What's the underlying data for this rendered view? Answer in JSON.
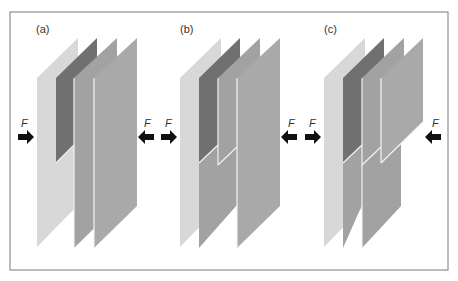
{
  "figure": {
    "frame": {
      "x": 10,
      "y": 12,
      "width": 438,
      "height": 258,
      "stroke": "#7a7a7a"
    },
    "colors": {
      "light_sheet": "#d8d8d8",
      "dark_sheet": "#707070",
      "mid_sheet": "#a2a2a2",
      "mid_sheet_alt": "#a9a9a9",
      "seam": "#f2f2f2",
      "arrow": "#111111"
    },
    "force_symbol": "F",
    "panels": [
      {
        "label": "(a)",
        "label_pos": [
          36,
          33
        ],
        "sheets": [
          {
            "name": "sheet-1-light",
            "color": "light_sheet",
            "points": "37,78 78,38 78,205 37,247"
          },
          {
            "name": "sheet-2-dark",
            "color": "dark_sheet",
            "points": "56,78 97,38 97,124 56,163"
          },
          {
            "name": "sheet-3-mid",
            "color": "mid_sheet",
            "points": "74,78 117,38 117,206 74,248"
          },
          {
            "name": "sheet-4-mid",
            "color": "mid_sheet_alt",
            "points": "94,78 137,38 137,206 94,248"
          }
        ],
        "seams": [
          {
            "points": "56,163 74,145"
          },
          {
            "points": "74,78 74,248"
          },
          {
            "points": "94,78 94,248"
          }
        ],
        "arrows": [
          {
            "direction": "right",
            "x": 18,
            "y": 137,
            "label_x": 21,
            "label_y": 127
          },
          {
            "direction": "left",
            "x": 154,
            "y": 137,
            "label_x": 144,
            "label_y": 127
          }
        ]
      },
      {
        "label": "(b)",
        "label_pos": [
          180,
          33
        ],
        "sheets": [
          {
            "name": "sheet-1-light",
            "color": "light_sheet",
            "points": "180,78 221,38 221,205 180,247"
          },
          {
            "name": "sheet-2-lower",
            "color": "mid_sheet",
            "points": "199,163 218,145 237,145 237,205 199,248"
          },
          {
            "name": "sheet-2-dark",
            "color": "dark_sheet",
            "points": "199,78 240,38 240,126 218,145 199,163"
          },
          {
            "name": "sheet-3-upper",
            "color": "mid_sheet",
            "points": "218,78 260,38 260,127 237,147 218,165"
          },
          {
            "name": "sheet-4-mid",
            "color": "mid_sheet_alt",
            "points": "237,78 280,38 280,206 237,248"
          }
        ],
        "seams": [
          {
            "points": "199,163 218,145"
          },
          {
            "points": "218,165 237,147"
          },
          {
            "points": "218,78 218,165"
          },
          {
            "points": "237,78 237,248"
          }
        ],
        "arrows": [
          {
            "direction": "right",
            "x": 161,
            "y": 137,
            "label_x": 165,
            "label_y": 127
          },
          {
            "direction": "left",
            "x": 297,
            "y": 137,
            "label_x": 288,
            "label_y": 127
          }
        ]
      },
      {
        "label": "(c)",
        "label_pos": [
          324,
          33
        ],
        "sheets": [
          {
            "name": "sheet-1-light",
            "color": "light_sheet",
            "points": "324,78 365,38 365,205 324,247"
          },
          {
            "name": "sheet-2-lower",
            "color": "mid_sheet",
            "points": "343,163 362,145 362,205 343,248"
          },
          {
            "name": "sheet-2-dark",
            "color": "dark_sheet",
            "points": "343,78 384,38 384,126 362,145 343,163"
          },
          {
            "name": "sheet-3-mid",
            "color": "mid_sheet",
            "points": "362,78 404,38 404,125 381,145 381,163 401,144 401,206 362,248"
          },
          {
            "name": "sheet-4-short",
            "color": "mid_sheet_alt",
            "points": "381,78 423,38 423,122 381,163"
          }
        ],
        "seams": [
          {
            "points": "343,163 362,145"
          },
          {
            "points": "362,165 381,147"
          },
          {
            "points": "381,163 423,122"
          },
          {
            "points": "362,78 362,248"
          },
          {
            "points": "381,78 381,163"
          }
        ],
        "arrows": [
          {
            "direction": "right",
            "x": 305,
            "y": 137,
            "label_x": 309,
            "label_y": 127
          },
          {
            "direction": "left",
            "x": 441,
            "y": 137,
            "label_x": 432,
            "label_y": 127
          }
        ]
      }
    ]
  }
}
